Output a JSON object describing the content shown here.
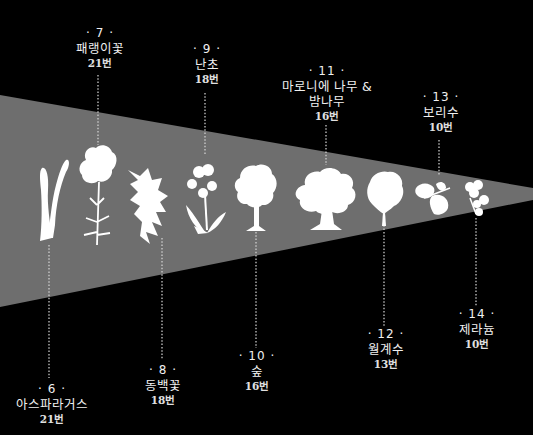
{
  "colors": {
    "background": "#000000",
    "wedge": "#6e6e6e",
    "silhouette": "#ffffff",
    "text": "#f0f0f0",
    "leader": "#d8d8d8"
  },
  "wedge": {
    "points": "0,95 533,188 533,200 0,307"
  },
  "items": [
    {
      "num": "· 6 ·",
      "name": "아스파라거스",
      "count": "21번",
      "icon": "asparagus-icon"
    },
    {
      "num": "· 7 ·",
      "name": "패랭이꽃",
      "count": "21번",
      "icon": "carnation-icon"
    },
    {
      "num": "· 8 ·",
      "name": "동백꽃",
      "count": "18번",
      "icon": "camellia-icon"
    },
    {
      "num": "· 9 ·",
      "name": "난초",
      "count": "18번",
      "icon": "orchid-icon"
    },
    {
      "num": "· 10 ·",
      "name": "숲",
      "count": "16번",
      "icon": "forest-tree-icon"
    },
    {
      "num": "· 11 ·",
      "name": "마로니에 나무 &",
      "name2": "밤나무",
      "count": "16번",
      "icon": "chestnut-tree-icon"
    },
    {
      "num": "· 12 ·",
      "name": "월계수",
      "count": "13번",
      "icon": "laurel-icon"
    },
    {
      "num": "· 13 ·",
      "name": "보리수",
      "count": "10번",
      "icon": "linden-leaf-icon"
    },
    {
      "num": "· 14 ·",
      "name": "제라늄",
      "count": "10번",
      "icon": "geranium-icon"
    }
  ]
}
